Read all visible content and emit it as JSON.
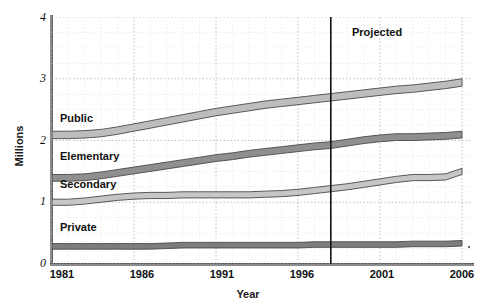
{
  "chart_data": {
    "type": "area",
    "title": "",
    "xlabel": "Year",
    "ylabel": "Millions",
    "xlim": [
      1981,
      2006
    ],
    "ylim": [
      0,
      4
    ],
    "ytick_labels": [
      "0",
      "1",
      "2",
      "3",
      "4"
    ],
    "ytick_values": [
      0,
      1,
      2,
      3,
      4
    ],
    "xtick_labels": [
      "1981",
      "1986",
      "1991",
      "1996",
      "2001",
      "2006"
    ],
    "xtick_values": [
      1981,
      1986,
      1991,
      1996,
      2001,
      2006
    ],
    "grid": true,
    "grid_style": "dotted",
    "legend": "inline-labels",
    "annotations": [
      {
        "name": "projection-divider",
        "text": "Projected",
        "x": 1998,
        "kind": "vertical-line-with-label"
      }
    ],
    "x": [
      1981,
      1982,
      1983,
      1984,
      1985,
      1986,
      1987,
      1988,
      1989,
      1990,
      1991,
      1992,
      1993,
      1994,
      1995,
      1996,
      1997,
      1998,
      1999,
      2000,
      2001,
      2002,
      2003,
      2004,
      2005,
      2006
    ],
    "series": [
      {
        "name": "Public",
        "color": "#bdbdbd",
        "band_thickness": 0.12,
        "values": [
          2.15,
          2.15,
          2.16,
          2.18,
          2.22,
          2.27,
          2.32,
          2.37,
          2.42,
          2.47,
          2.52,
          2.56,
          2.6,
          2.64,
          2.67,
          2.7,
          2.73,
          2.76,
          2.79,
          2.82,
          2.85,
          2.88,
          2.9,
          2.93,
          2.96,
          3.0
        ]
      },
      {
        "name": "Elementary",
        "color": "#8f8f8f",
        "band_thickness": 0.11,
        "values": [
          1.45,
          1.45,
          1.46,
          1.49,
          1.53,
          1.57,
          1.61,
          1.65,
          1.69,
          1.73,
          1.77,
          1.8,
          1.84,
          1.87,
          1.9,
          1.93,
          1.96,
          1.98,
          2.02,
          2.06,
          2.09,
          2.11,
          2.11,
          2.12,
          2.13,
          2.15
        ]
      },
      {
        "name": "Secondary",
        "color": "#c6c6c6",
        "band_thickness": 0.1,
        "values": [
          1.05,
          1.05,
          1.07,
          1.1,
          1.13,
          1.15,
          1.16,
          1.16,
          1.17,
          1.17,
          1.17,
          1.17,
          1.17,
          1.18,
          1.19,
          1.21,
          1.24,
          1.27,
          1.3,
          1.34,
          1.38,
          1.42,
          1.45,
          1.45,
          1.46,
          1.55
        ]
      },
      {
        "name": "Private",
        "color": "#7d7d7d",
        "band_thickness": 0.09,
        "values": [
          0.33,
          0.33,
          0.33,
          0.33,
          0.33,
          0.33,
          0.33,
          0.34,
          0.35,
          0.35,
          0.35,
          0.35,
          0.35,
          0.35,
          0.35,
          0.35,
          0.36,
          0.36,
          0.36,
          0.36,
          0.36,
          0.36,
          0.37,
          0.37,
          0.37,
          0.38
        ]
      }
    ]
  },
  "axes": {
    "ylabel": "Millions",
    "xlabel": "Year",
    "yticks": [
      "4",
      "3",
      "2",
      "1",
      "0"
    ],
    "xticks": [
      "1981",
      "1986",
      "1991",
      "1996",
      "2001",
      "2006"
    ]
  },
  "labels": {
    "public": "Public",
    "elementary": "Elementary",
    "secondary": "Secondary",
    "private": "Private",
    "projected": "Projected"
  }
}
